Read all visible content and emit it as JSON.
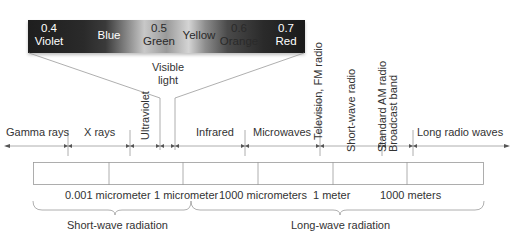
{
  "spectrum_bar": {
    "labels": [
      {
        "value": "0.4",
        "name": "Violet"
      },
      {
        "value": "",
        "name": "Blue"
      },
      {
        "value": "0.5",
        "name": "Green"
      },
      {
        "value": "",
        "name": "Yellow"
      },
      {
        "value": "0.6",
        "name": "Orange"
      },
      {
        "value": "0.7",
        "name": "Red"
      }
    ]
  },
  "visible_light": {
    "line1": "Visible",
    "line2": "light"
  },
  "bands": [
    {
      "label": "Gamma rays"
    },
    {
      "label": "X rays"
    },
    {
      "label": "Ultraviolet"
    },
    {
      "label": "Infrared"
    },
    {
      "label": "Microwaves"
    },
    {
      "label": "Television, FM radio"
    },
    {
      "label": "Short-wave radio"
    },
    {
      "label": "Standard AM radio"
    },
    {
      "label": "Broadcast band"
    },
    {
      "label": "Long radio waves"
    }
  ],
  "scale": [
    {
      "label": "0.001 micrometer"
    },
    {
      "label": "1 micrometer"
    },
    {
      "label": "1000 micrometers"
    },
    {
      "label": "1 meter"
    },
    {
      "label": "1000 meters"
    }
  ],
  "radiation": {
    "short": "Short-wave radiation",
    "long": "Long-wave radiation"
  },
  "colors": {
    "line": "#9a9a9a",
    "text": "#333333",
    "spectrum_dark": "#1e1e1e",
    "spectrum_light": "#d4d4d4"
  }
}
